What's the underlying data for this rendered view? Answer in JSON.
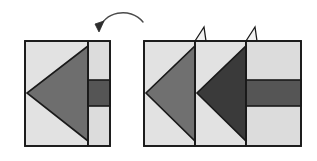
{
  "figure": {
    "title": "Geometric transformation diagram",
    "description": "A square shape on the left with a left-pointing medium gray triangle and a dark gray horizontal band, a curved counterclockwise rotation arrow above, and a wider composite figure on the right showing two stacked triangles with fold tabs.",
    "background_color": "#ffffff",
    "stroke_color": "#1a1a1a",
    "stroke_width": 1.6
  },
  "palette": {
    "light_gray": "#e2e2e2",
    "light_gray_2": "#dcdcdc",
    "medium_gray": "#6e6e6e",
    "medium_gray_2": "#707070",
    "dark_gray": "#3a3a3a",
    "band_gray": "#555555",
    "outline": "#1a1a1a",
    "tab_fill": "#f2f2f2"
  },
  "arrow": {
    "label": "rotation-arrow",
    "direction": "counterclockwise",
    "path": "M 99 30 C 103 12, 130 6, 143 22",
    "head_points": "99,32 104,21 95,24",
    "color": "#4a4a4a",
    "width": 1.4
  },
  "left_figure": {
    "name": "left-shape",
    "bounds": {
      "x": 25,
      "y": 41,
      "width": 85,
      "height": 105
    },
    "panels": [
      {
        "name": "main-panel",
        "x": 25,
        "y": 41,
        "width": 63,
        "height": 105,
        "fill": "#e2e2e2"
      },
      {
        "name": "side-panel",
        "x": 88,
        "y": 41,
        "width": 22,
        "height": 105,
        "fill": "#dcdcdc"
      }
    ],
    "triangle": {
      "name": "left-triangle",
      "points": "88,46 88,141 27,93",
      "fill": "#6e6e6e"
    },
    "band": {
      "name": "dark-band",
      "x": 88,
      "y": 80,
      "width": 22,
      "height": 26,
      "fill": "#555555"
    },
    "divider": {
      "name": "panel-divider",
      "x1": 88,
      "y1": 41,
      "x2": 88,
      "y2": 146
    }
  },
  "right_figure": {
    "name": "right-shape",
    "bounds": {
      "x": 144,
      "y": 41,
      "width": 157,
      "height": 105
    },
    "panels": [
      {
        "name": "panel-a",
        "x": 144,
        "y": 41,
        "width": 51,
        "height": 105,
        "fill": "#e2e2e2"
      },
      {
        "name": "panel-b",
        "x": 195,
        "y": 41,
        "width": 51,
        "height": 105,
        "fill": "#e2e2e2"
      },
      {
        "name": "panel-c",
        "x": 246,
        "y": 41,
        "width": 55,
        "height": 105,
        "fill": "#dcdcdc"
      }
    ],
    "triangles": [
      {
        "name": "right-triangle-light",
        "points": "195,46 195,141 146,93",
        "fill": "#707070"
      },
      {
        "name": "right-triangle-dark",
        "points": "246,46 246,141 197,93",
        "fill": "#3a3a3a"
      }
    ],
    "band": {
      "name": "dark-band",
      "x": 246,
      "y": 80,
      "width": 55,
      "height": 26,
      "fill": "#555555"
    },
    "dividers": [
      {
        "name": "panel-divider-1",
        "x1": 195,
        "y1": 41,
        "x2": 195,
        "y2": 146
      },
      {
        "name": "panel-divider-2",
        "x1": 246,
        "y1": 41,
        "x2": 246,
        "y2": 146
      }
    ],
    "tabs": [
      {
        "name": "fold-tab-left",
        "points": "195,41 204,27 206,41",
        "fill": "#f2f2f2"
      },
      {
        "name": "fold-tab-right",
        "points": "246,41 255,27 257,41",
        "fill": "#f2f2f2"
      }
    ]
  }
}
